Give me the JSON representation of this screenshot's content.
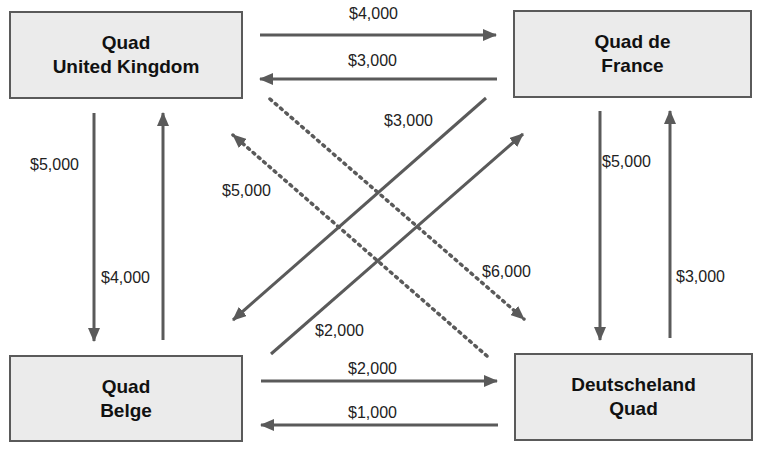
{
  "nodes": {
    "uk": {
      "line1": "Quad",
      "line2": "United Kingdom"
    },
    "france": {
      "line1": "Quad de",
      "line2": "France"
    },
    "belge": {
      "line1": "Quad",
      "line2": "Belge"
    },
    "germany": {
      "line1": "Deutscheland",
      "line2": "Quad"
    }
  },
  "edges": [
    {
      "from": "Quad United Kingdom",
      "to": "Quad de France",
      "amount": "$4,000",
      "style": "solid"
    },
    {
      "from": "Quad de France",
      "to": "Quad United Kingdom",
      "amount": "$3,000",
      "style": "solid"
    },
    {
      "from": "Quad United Kingdom",
      "to": "Quad Belge",
      "amount": "$5,000",
      "style": "solid"
    },
    {
      "from": "Quad Belge",
      "to": "Quad United Kingdom",
      "amount": "$4,000",
      "style": "solid"
    },
    {
      "from": "Quad de France",
      "to": "Deutscheland Quad",
      "amount": "$5,000",
      "style": "solid"
    },
    {
      "from": "Deutscheland Quad",
      "to": "Quad de France",
      "amount": "$3,000",
      "style": "solid"
    },
    {
      "from": "Quad Belge",
      "to": "Deutscheland Quad",
      "amount": "$2,000",
      "style": "solid"
    },
    {
      "from": "Deutscheland Quad",
      "to": "Quad Belge",
      "amount": "$1,000",
      "style": "solid"
    },
    {
      "from": "Quad de France",
      "to": "Quad Belge",
      "amount": "$3,000",
      "style": "solid"
    },
    {
      "from": "Quad Belge",
      "to": "Quad de France",
      "amount": "$2,000",
      "style": "solid"
    },
    {
      "from": "Quad United Kingdom",
      "to": "Deutscheland Quad",
      "amount": "$6,000",
      "style": "dotted"
    },
    {
      "from": "Deutscheland Quad",
      "to": "Quad United Kingdom",
      "amount": "$5,000",
      "style": "dotted"
    }
  ],
  "labels": {
    "uk_to_fr": "$4,000",
    "fr_to_uk": "$3,000",
    "uk_to_be": "$5,000",
    "be_to_uk": "$4,000",
    "fr_to_de": "$5,000",
    "de_to_fr": "$3,000",
    "be_to_de": "$2,000",
    "de_to_be": "$1,000",
    "fr_to_be": "$3,000",
    "be_to_fr": "$2,000",
    "uk_to_de": "$6,000",
    "de_to_uk": "$5,000"
  },
  "colors": {
    "arrow": "#5a5a5a",
    "box_fill": "#ebebeb",
    "box_border": "#5a5a5a"
  }
}
